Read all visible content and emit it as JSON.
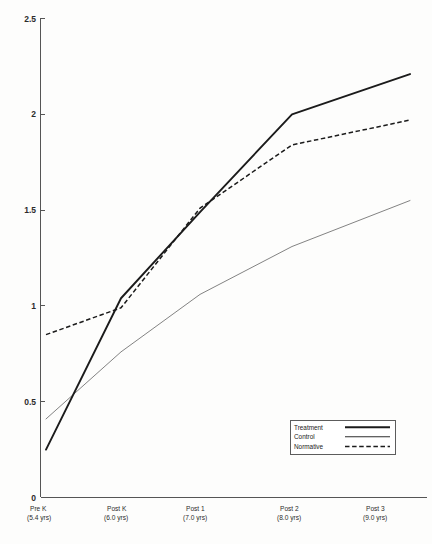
{
  "chart_data": {
    "type": "line",
    "title": "",
    "subtitle": "",
    "xlabel": "",
    "ylabel": "",
    "grid": false,
    "legend_position": "bottom-right",
    "ylim": [
      0,
      2.5
    ],
    "ytick_labels": [
      "0",
      "0.5",
      "1",
      "1.5",
      "2",
      "2.5"
    ],
    "ytick_values": [
      0,
      0.5,
      1,
      1.5,
      2,
      2.5
    ],
    "categories": [
      "Pre K",
      "Post K",
      "Post 1",
      "Post 2",
      "Post 3"
    ],
    "category_sublabels": [
      "(5.4 yrs)",
      "(6.0 yrs)",
      "(7.0 yrs)",
      "(8.0 yrs)",
      "(9.0 yrs)"
    ],
    "series": [
      {
        "name": "Treatment",
        "style": "thick-solid",
        "color": "#1b1b1b",
        "values": [
          0.25,
          1.04,
          1.49,
          2.0,
          2.21
        ]
      },
      {
        "name": "Control",
        "style": "thin-solid",
        "color": "#5a5a5a",
        "values": [
          0.41,
          0.76,
          1.06,
          1.31,
          1.55
        ]
      },
      {
        "name": "Normative",
        "style": "dashed",
        "color": "#1b1b1b",
        "values": [
          0.85,
          0.99,
          1.51,
          1.84,
          1.97
        ]
      }
    ]
  },
  "legend": {
    "entries": [
      {
        "label": "Treatment"
      },
      {
        "label": "Control"
      },
      {
        "label": "Normative"
      }
    ]
  }
}
